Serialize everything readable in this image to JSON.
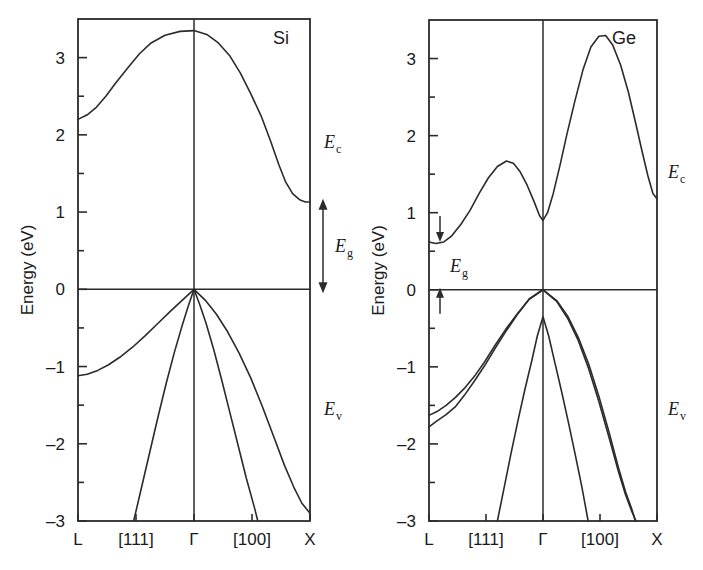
{
  "figure": {
    "type": "band-structure-diagram",
    "background": "#ffffff",
    "ink_color": "#2b2b2b",
    "width": 703,
    "height": 570
  },
  "axis": {
    "ylabel": "Energy (eV)",
    "ytick_labels": [
      "3",
      "2",
      "1",
      "0",
      "-1",
      "-2",
      "-3"
    ],
    "ytick_values": [
      3,
      2,
      1,
      0,
      -1,
      -2,
      -3
    ],
    "yminor_values": [
      2.5,
      1.5,
      0.5,
      -0.5,
      -1.5,
      -2.5
    ],
    "ylim": [
      -3,
      3.5
    ],
    "xtick_labels": [
      "L",
      "[111]",
      "Γ",
      "[100]",
      "X"
    ],
    "xtick_positions": [
      0,
      0.25,
      0.5,
      0.75,
      1.0
    ]
  },
  "panels": [
    {
      "id": "si",
      "title": "Si",
      "annotations": {
        "ec": "E",
        "ec_sub": "c",
        "ev": "E",
        "ev_sub": "v",
        "eg": "E",
        "eg_sub": "g"
      },
      "gap_arrow": {
        "style": "double-headed",
        "top_eV": 1.12,
        "bottom_eV": 0.0
      }
    },
    {
      "id": "ge",
      "title": "Ge",
      "annotations": {
        "ec": "E",
        "ec_sub": "c",
        "ev": "E",
        "ev_sub": "v",
        "eg": "E",
        "eg_sub": "g"
      },
      "gap_arrow": {
        "style": "two-single-arrows",
        "top_eV": 0.66,
        "bottom_eV": 0.0
      }
    }
  ],
  "chart_data": {
    "type": "line",
    "xlabel": "",
    "ylabel": "Energy (eV)",
    "ylim": [
      -3,
      3.5
    ],
    "xlim": [
      0,
      1
    ],
    "grid": false,
    "legend": "none",
    "x_axis_ticklabels": [
      "L",
      "[111]",
      "Γ",
      "[100]",
      "X"
    ],
    "subplots": [
      {
        "name": "Si",
        "series": [
          {
            "name": "conduction-band",
            "comment": "L=2.2 eV rising to 3.35 eV at Gamma, falling to X-valley minimum 1.12 eV",
            "points": [
              [
                0.0,
                2.2
              ],
              [
                0.04,
                2.26
              ],
              [
                0.08,
                2.36
              ],
              [
                0.12,
                2.5
              ],
              [
                0.165,
                2.68
              ],
              [
                0.215,
                2.87
              ],
              [
                0.265,
                3.05
              ],
              [
                0.315,
                3.19
              ],
              [
                0.375,
                3.29
              ],
              [
                0.44,
                3.34
              ],
              [
                0.5,
                3.35
              ],
              [
                0.555,
                3.3
              ],
              [
                0.605,
                3.19
              ],
              [
                0.655,
                3.02
              ],
              [
                0.7,
                2.8
              ],
              [
                0.745,
                2.53
              ],
              [
                0.79,
                2.24
              ],
              [
                0.83,
                1.92
              ],
              [
                0.865,
                1.62
              ],
              [
                0.895,
                1.39
              ],
              [
                0.925,
                1.24
              ],
              [
                0.955,
                1.16
              ],
              [
                0.98,
                1.13
              ],
              [
                1.0,
                1.13
              ]
            ]
          },
          {
            "name": "valence-band-light-hole",
            "comment": "L = -1.1 eV, peak 0 eV at Gamma, falls to -2.9 eV at X",
            "points": [
              [
                0.0,
                -1.12
              ],
              [
                0.04,
                -1.1
              ],
              [
                0.085,
                -1.05
              ],
              [
                0.13,
                -0.98
              ],
              [
                0.18,
                -0.88
              ],
              [
                0.235,
                -0.75
              ],
              [
                0.29,
                -0.6
              ],
              [
                0.345,
                -0.44
              ],
              [
                0.4,
                -0.28
              ],
              [
                0.45,
                -0.14
              ],
              [
                0.5,
                0.0
              ],
              [
                0.548,
                -0.14
              ],
              [
                0.596,
                -0.32
              ],
              [
                0.645,
                -0.55
              ],
              [
                0.695,
                -0.83
              ],
              [
                0.745,
                -1.15
              ],
              [
                0.795,
                -1.52
              ],
              [
                0.845,
                -1.92
              ],
              [
                0.89,
                -2.28
              ],
              [
                0.93,
                -2.56
              ],
              [
                0.965,
                -2.77
              ],
              [
                1.0,
                -2.9
              ]
            ]
          },
          {
            "name": "valence-band-heavy-hole",
            "comment": "steep band through Gamma, exits bottom near [111] and [100]",
            "points": [
              [
                0.24,
                -3.0
              ],
              [
                0.275,
                -2.55
              ],
              [
                0.31,
                -2.1
              ],
              [
                0.345,
                -1.65
              ],
              [
                0.38,
                -1.22
              ],
              [
                0.415,
                -0.82
              ],
              [
                0.45,
                -0.46
              ],
              [
                0.475,
                -0.22
              ],
              [
                0.5,
                0.0
              ],
              [
                0.525,
                -0.2
              ],
              [
                0.552,
                -0.44
              ],
              [
                0.585,
                -0.78
              ],
              [
                0.62,
                -1.18
              ],
              [
                0.655,
                -1.6
              ],
              [
                0.69,
                -2.02
              ],
              [
                0.725,
                -2.44
              ],
              [
                0.76,
                -2.82
              ],
              [
                0.775,
                -3.0
              ]
            ]
          }
        ]
      },
      {
        "name": "Ge",
        "series": [
          {
            "name": "conduction-band",
            "comment": "L-valley minimum 0.66 eV, local max 1.67 eV, Gamma dip 0.90 eV, peak 3.30 eV, X 1.18 eV",
            "points": [
              [
                0.0,
                0.62
              ],
              [
                0.03,
                0.6
              ],
              [
                0.065,
                0.62
              ],
              [
                0.1,
                0.7
              ],
              [
                0.14,
                0.85
              ],
              [
                0.18,
                1.03
              ],
              [
                0.22,
                1.25
              ],
              [
                0.26,
                1.45
              ],
              [
                0.3,
                1.6
              ],
              [
                0.34,
                1.67
              ],
              [
                0.37,
                1.64
              ],
              [
                0.4,
                1.53
              ],
              [
                0.43,
                1.36
              ],
              [
                0.46,
                1.15
              ],
              [
                0.485,
                0.96
              ],
              [
                0.5,
                0.9
              ],
              [
                0.52,
                1.0
              ],
              [
                0.545,
                1.25
              ],
              [
                0.575,
                1.62
              ],
              [
                0.605,
                2.02
              ],
              [
                0.64,
                2.45
              ],
              [
                0.675,
                2.85
              ],
              [
                0.71,
                3.15
              ],
              [
                0.745,
                3.29
              ],
              [
                0.775,
                3.3
              ],
              [
                0.805,
                3.18
              ],
              [
                0.84,
                2.92
              ],
              [
                0.875,
                2.56
              ],
              [
                0.905,
                2.18
              ],
              [
                0.935,
                1.79
              ],
              [
                0.96,
                1.48
              ],
              [
                0.982,
                1.25
              ],
              [
                1.0,
                1.18
              ]
            ]
          },
          {
            "name": "valence-band-heavy-hole",
            "comment": "L = -1.63 eV, peak 0 eV at Gamma, falls steeply past [100]",
            "points": [
              [
                0.0,
                -1.63
              ],
              [
                0.035,
                -1.58
              ],
              [
                0.075,
                -1.5
              ],
              [
                0.115,
                -1.4
              ],
              [
                0.155,
                -1.28
              ],
              [
                0.2,
                -1.12
              ],
              [
                0.245,
                -0.93
              ],
              [
                0.29,
                -0.72
              ],
              [
                0.335,
                -0.52
              ],
              [
                0.385,
                -0.32
              ],
              [
                0.44,
                -0.12
              ],
              [
                0.5,
                0.0
              ],
              [
                0.56,
                -0.14
              ],
              [
                0.61,
                -0.35
              ],
              [
                0.655,
                -0.62
              ],
              [
                0.7,
                -0.96
              ],
              [
                0.745,
                -1.38
              ],
              [
                0.79,
                -1.85
              ],
              [
                0.83,
                -2.3
              ],
              [
                0.862,
                -2.62
              ],
              [
                0.89,
                -2.85
              ],
              [
                0.905,
                -3.0
              ]
            ]
          },
          {
            "name": "valence-band-light-hole",
            "comment": "L = -1.78 eV, merges with heavy band toward Gamma",
            "points": [
              [
                0.0,
                -1.78
              ],
              [
                0.035,
                -1.7
              ],
              [
                0.075,
                -1.62
              ],
              [
                0.115,
                -1.52
              ],
              [
                0.155,
                -1.37
              ],
              [
                0.2,
                -1.18
              ],
              [
                0.245,
                -0.98
              ],
              [
                0.29,
                -0.76
              ],
              [
                0.335,
                -0.55
              ],
              [
                0.385,
                -0.33
              ],
              [
                0.44,
                -0.12
              ],
              [
                0.5,
                0.0
              ],
              [
                0.56,
                -0.15
              ],
              [
                0.61,
                -0.38
              ],
              [
                0.655,
                -0.66
              ],
              [
                0.7,
                -1.02
              ],
              [
                0.745,
                -1.45
              ],
              [
                0.79,
                -1.92
              ],
              [
                0.83,
                -2.35
              ],
              [
                0.862,
                -2.66
              ],
              [
                0.89,
                -2.88
              ],
              [
                0.908,
                -3.0
              ]
            ]
          },
          {
            "name": "valence-band-split-off",
            "comment": "steep narrow band peaking at -0.35 eV at Gamma",
            "points": [
              [
                0.3,
                -3.0
              ],
              [
                0.33,
                -2.56
              ],
              [
                0.36,
                -2.12
              ],
              [
                0.39,
                -1.7
              ],
              [
                0.42,
                -1.3
              ],
              [
                0.45,
                -0.93
              ],
              [
                0.475,
                -0.6
              ],
              [
                0.5,
                -0.35
              ],
              [
                0.525,
                -0.6
              ],
              [
                0.55,
                -0.92
              ],
              [
                0.58,
                -1.3
              ],
              [
                0.61,
                -1.7
              ],
              [
                0.64,
                -2.12
              ],
              [
                0.67,
                -2.55
              ],
              [
                0.698,
                -3.0
              ]
            ]
          }
        ]
      }
    ]
  }
}
